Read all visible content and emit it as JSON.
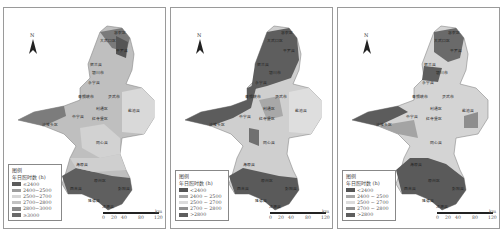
{
  "figure": {
    "region": "Ningxia",
    "panels": [
      {
        "id": "a",
        "legend": {
          "title": "图例",
          "subtitle": "年日照时数 (h)",
          "classes": [
            {
              "label": "≤2400",
              "color": "#5b5b5b"
            },
            {
              "label": "2400~2500",
              "color": "#9d9d9d"
            },
            {
              "label": "2500~2700",
              "color": "#d6d6d6"
            },
            {
              "label": "2700~2800",
              "color": "#c2c2c2"
            },
            {
              "label": "2800~3000",
              "color": "#8a8a8a"
            },
            {
              "label": "≥3000",
              "color": "#6a6a6a"
            }
          ]
        }
      },
      {
        "id": "b",
        "legend": {
          "title": "图例",
          "subtitle": "年日照时数 (h)",
          "classes": [
            {
              "label": "<2400",
              "color": "#555555"
            },
            {
              "label": "2400 ~ 2500",
              "color": "#a6a6a6"
            },
            {
              "label": "2500 ~ 2700",
              "color": "#dcdcdc"
            },
            {
              "label": "2700 ~ 2800",
              "color": "#8f8f8f"
            },
            {
              "label": ">2800",
              "color": "#5e5e5e"
            }
          ]
        }
      },
      {
        "id": "c",
        "legend": {
          "title": "图例",
          "subtitle": "年日照时数 (h)",
          "classes": [
            {
              "label": "<2400",
              "color": "#555555"
            },
            {
              "label": "2400 ~ 2500",
              "color": "#a6a6a6"
            },
            {
              "label": "2500 ~ 2700",
              "color": "#dcdcdc"
            },
            {
              "label": "2700 ~ 2800",
              "color": "#8f8f8f"
            },
            {
              "label": ">2800",
              "color": "#5e5e5e"
            }
          ]
        }
      }
    ],
    "north_arrow": "N",
    "scale_bar": {
      "ticks": [
        "0",
        "20",
        "40",
        "80",
        "120"
      ],
      "unit": "km"
    },
    "county_labels": [
      "惠农区",
      "大武口区",
      "平罗县",
      "贺兰县",
      "银川市",
      "永宁县",
      "青铜峡市",
      "灵武市",
      "利通区",
      "盐池县",
      "中宁县",
      "沙坡头区",
      "红寺堡区",
      "同心县",
      "海原县",
      "原州区",
      "西吉县",
      "彭阳县",
      "隆德县",
      "泾源县"
    ]
  }
}
